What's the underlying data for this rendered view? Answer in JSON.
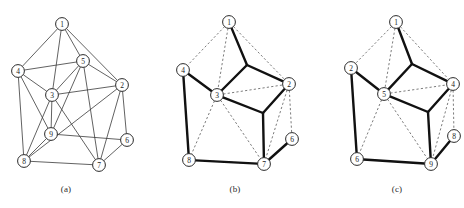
{
  "figure": {
    "width": 464,
    "height": 208,
    "colors": {
      "background": "#ffffff",
      "node_fill": "#ffffff",
      "node_stroke": "#2a2a2a",
      "edge_thin": "#3a3a3a",
      "edge_dashed": "#5a5a5a",
      "edge_bold": "#111111",
      "text": "#1a1a1a"
    }
  },
  "captions": {
    "a": "(a)",
    "b": "(b)",
    "c": "(c)"
  },
  "chart_data": {
    "type": "diagram",
    "title": "",
    "panels": [
      {
        "id": "a",
        "caption": "(a)",
        "style": "all-edges-thin",
        "nodes": [
          {
            "id": "1",
            "label": "1",
            "x": 62,
            "y": 24
          },
          {
            "id": "2",
            "label": "2",
            "x": 122,
            "y": 85
          },
          {
            "id": "3",
            "label": "3",
            "x": 52,
            "y": 95
          },
          {
            "id": "4",
            "label": "4",
            "x": 18,
            "y": 71
          },
          {
            "id": "5",
            "label": "5",
            "x": 83,
            "y": 61
          },
          {
            "id": "6",
            "label": "6",
            "x": 127,
            "y": 140
          },
          {
            "id": "7",
            "label": "7",
            "x": 99,
            "y": 165
          },
          {
            "id": "8",
            "label": "8",
            "x": 24,
            "y": 161
          },
          {
            "id": "9",
            "label": "9",
            "x": 51,
            "y": 134
          }
        ],
        "edges": [
          [
            "1",
            "4"
          ],
          [
            "1",
            "5"
          ],
          [
            "1",
            "2"
          ],
          [
            "1",
            "3"
          ],
          [
            "4",
            "5"
          ],
          [
            "4",
            "3"
          ],
          [
            "4",
            "8"
          ],
          [
            "4",
            "9"
          ],
          [
            "5",
            "2"
          ],
          [
            "5",
            "3"
          ],
          [
            "5",
            "9"
          ],
          [
            "5",
            "7"
          ],
          [
            "2",
            "3"
          ],
          [
            "2",
            "6"
          ],
          [
            "2",
            "7"
          ],
          [
            "2",
            "8"
          ],
          [
            "3",
            "8"
          ],
          [
            "3",
            "9"
          ],
          [
            "3",
            "7"
          ],
          [
            "9",
            "6"
          ],
          [
            "9",
            "8"
          ],
          [
            "8",
            "7"
          ],
          [
            "7",
            "6"
          ]
        ]
      },
      {
        "id": "b",
        "caption": "(b)",
        "style": "steiner-tree-bold-over-dashed",
        "nodes": [
          {
            "id": "1",
            "label": "1",
            "x": 229,
            "y": 22
          },
          {
            "id": "2",
            "label": "2",
            "x": 289,
            "y": 84
          },
          {
            "id": "3",
            "label": "3",
            "x": 217,
            "y": 95
          },
          {
            "id": "4",
            "label": "4",
            "x": 183,
            "y": 70
          },
          {
            "id": "6",
            "label": "6",
            "x": 292,
            "y": 139
          },
          {
            "id": "7",
            "label": "7",
            "x": 264,
            "y": 164
          },
          {
            "id": "8",
            "label": "8",
            "x": 189,
            "y": 160
          }
        ],
        "dashed_edges": [
          [
            "1",
            "4"
          ],
          [
            "1",
            "2"
          ],
          [
            "1",
            "3"
          ],
          [
            "4",
            "3"
          ],
          [
            "4",
            "8"
          ],
          [
            "3",
            "2"
          ],
          [
            "3",
            "8"
          ],
          [
            "3",
            "7"
          ],
          [
            "2",
            "6"
          ],
          [
            "2",
            "7"
          ],
          [
            "8",
            "7"
          ],
          [
            "7",
            "6"
          ]
        ],
        "bold_path": {
          "steiner_points": [
            {
              "id": "s1",
              "x": 247,
              "y": 65
            },
            {
              "id": "s2",
              "x": 263,
              "y": 113
            }
          ],
          "segments": [
            [
              "1",
              "s1"
            ],
            [
              "s1",
              "3"
            ],
            [
              "s1",
              "2"
            ],
            [
              "3",
              "4"
            ],
            [
              "4",
              "8"
            ],
            [
              "3",
              "s2"
            ],
            [
              "s2",
              "2"
            ],
            [
              "s2",
              "7"
            ],
            [
              "8",
              "7"
            ],
            [
              "7",
              "6"
            ]
          ]
        }
      },
      {
        "id": "c",
        "caption": "(c)",
        "style": "steiner-tree-bold-over-dashed",
        "nodes": [
          {
            "id": "1",
            "label": "1",
            "x": 396,
            "y": 22
          },
          {
            "id": "2",
            "label": "2",
            "x": 351,
            "y": 68
          },
          {
            "id": "4",
            "label": "4",
            "x": 453,
            "y": 84
          },
          {
            "id": "5",
            "label": "5",
            "x": 384,
            "y": 94
          },
          {
            "id": "6",
            "label": "6",
            "x": 357,
            "y": 159
          },
          {
            "id": "8",
            "label": "8",
            "x": 454,
            "y": 136
          },
          {
            "id": "9",
            "label": "9",
            "x": 431,
            "y": 164
          }
        ],
        "dashed_edges": [
          [
            "1",
            "2"
          ],
          [
            "1",
            "4"
          ],
          [
            "1",
            "5"
          ],
          [
            "2",
            "5"
          ],
          [
            "2",
            "6"
          ],
          [
            "5",
            "4"
          ],
          [
            "5",
            "6"
          ],
          [
            "5",
            "9"
          ],
          [
            "4",
            "8"
          ],
          [
            "4",
            "9"
          ],
          [
            "6",
            "9"
          ],
          [
            "9",
            "8"
          ]
        ],
        "bold_path": {
          "steiner_points": [
            {
              "id": "s1",
              "x": 412,
              "y": 64
            },
            {
              "id": "s2",
              "x": 428,
              "y": 112
            }
          ],
          "segments": [
            [
              "1",
              "s1"
            ],
            [
              "s1",
              "5"
            ],
            [
              "s1",
              "4"
            ],
            [
              "5",
              "2"
            ],
            [
              "2",
              "6"
            ],
            [
              "5",
              "s2"
            ],
            [
              "s2",
              "4"
            ],
            [
              "s2",
              "9"
            ],
            [
              "6",
              "9"
            ],
            [
              "9",
              "8"
            ]
          ]
        }
      }
    ]
  }
}
